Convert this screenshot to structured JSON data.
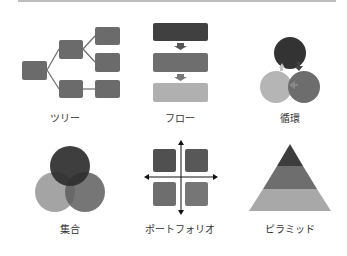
{
  "colors": {
    "divider": "#bdbdbd",
    "tree_box": "#6b6b6b",
    "flow_top": "#404040",
    "flow_mid": "#6e6e6e",
    "flow_bottom": "#b0b0b0",
    "cycle_dark": "#333333",
    "cycle_mid": "#6d6d6d",
    "cycle_light": "#b5b5b5",
    "venn_top": "#2e2e2e",
    "venn_left": "#9a9a9a",
    "venn_right": "#5e5e5e",
    "portfolio_tl": "#505050",
    "portfolio_tr": "#585858",
    "portfolio_bl": "#6e6e6e",
    "portfolio_br": "#767676",
    "pyramid_top": "#3d3d3d",
    "pyramid_mid": "#6e6e6e",
    "pyramid_bottom": "#a8a8a8",
    "label_text": "#333333"
  },
  "categories": [
    {
      "id": "tree",
      "label": "ツリー",
      "icon": "tree-diagram-icon"
    },
    {
      "id": "flow",
      "label": "フロー",
      "icon": "flow-diagram-icon"
    },
    {
      "id": "cycle",
      "label": "循環",
      "icon": "cycle-diagram-icon"
    },
    {
      "id": "venn",
      "label": "集合",
      "icon": "venn-diagram-icon"
    },
    {
      "id": "portfolio",
      "label": "ポートフォリオ",
      "icon": "portfolio-matrix-icon"
    },
    {
      "id": "pyramid",
      "label": "ピラミッド",
      "icon": "pyramid-diagram-icon"
    }
  ]
}
